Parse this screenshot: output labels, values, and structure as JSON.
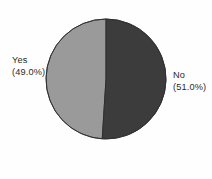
{
  "figure": {
    "background_color": "#fefefe",
    "text_color": "#2b2b2b"
  },
  "chart_data": {
    "type": "pie",
    "title": "",
    "subtitle": "",
    "xlabel": "",
    "ylabel": "",
    "legend_position": "none",
    "grid": false,
    "labels_outside": true,
    "start_angle_deg": 90,
    "direction": "clockwise",
    "categories": [
      "No",
      "Yes"
    ],
    "values": [
      51.0,
      49.0
    ],
    "value_unit": "%",
    "colors": [
      "#3c3c3c",
      "#9a9a9a"
    ],
    "edge_color": "#2d2d2d",
    "slices": [
      {
        "name": "No",
        "percent": 51.0,
        "label_text": "No",
        "percent_text": "(51.0%)",
        "color": "#3c3c3c",
        "side": "right"
      },
      {
        "name": "Yes",
        "percent": 49.0,
        "label_text": "Yes",
        "percent_text": "(49.0%)",
        "color": "#9a9a9a",
        "side": "left"
      }
    ]
  },
  "labels": {
    "yes": {
      "name": "Yes",
      "percent": "(49.0%)"
    },
    "no": {
      "name": "No",
      "percent": "(51.0%)"
    }
  }
}
